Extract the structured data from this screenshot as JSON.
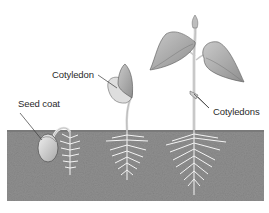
{
  "diagram": {
    "type": "bean seed germination stages",
    "stages": [
      {
        "name": "seed",
        "description": "seed in soil with emerging root"
      },
      {
        "name": "seedling",
        "description": "young seedling with cotyledon above soil"
      },
      {
        "name": "young-plant",
        "description": "plant with true leaves and cotyledons"
      }
    ],
    "labels": {
      "seed_coat": "Seed coat",
      "cotyledon": "Cotyledon",
      "cotyledons": "Cotyledons"
    },
    "colors": {
      "soil": "#8f8f8f",
      "soil_dark": "#7c7c7c",
      "leaf": "#b9b9b9",
      "leaf_shade": "#8e8e8e",
      "stem": "#d8d8d8",
      "root": "#f4f4f4",
      "seed": "#dcdcdc",
      "line": "#3a3a3a",
      "background": "#ffffff"
    }
  }
}
